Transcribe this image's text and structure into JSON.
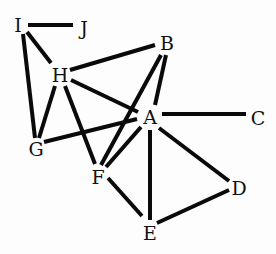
{
  "diagram": {
    "type": "undirected-graph",
    "nodes": [
      {
        "id": "I",
        "label": "I",
        "x": 18,
        "y": 25
      },
      {
        "id": "J",
        "label": "J",
        "x": 84,
        "y": 28
      },
      {
        "id": "H",
        "label": "H",
        "x": 60,
        "y": 75
      },
      {
        "id": "B",
        "label": "B",
        "x": 167,
        "y": 43
      },
      {
        "id": "A",
        "label": "A",
        "x": 150,
        "y": 117
      },
      {
        "id": "C",
        "label": "C",
        "x": 258,
        "y": 118
      },
      {
        "id": "G",
        "label": "G",
        "x": 36,
        "y": 149
      },
      {
        "id": "F",
        "label": "F",
        "x": 98,
        "y": 177
      },
      {
        "id": "D",
        "label": "D",
        "x": 239,
        "y": 188
      },
      {
        "id": "E",
        "label": "E",
        "x": 150,
        "y": 233
      }
    ],
    "edges": [
      {
        "from": "I",
        "to": "J",
        "x1": 28,
        "y1": 25,
        "x2": 73,
        "y2": 25
      },
      {
        "from": "I",
        "to": "H",
        "x1": 27,
        "y1": 32,
        "x2": 51,
        "y2": 63
      },
      {
        "from": "I",
        "to": "G",
        "x1": 23,
        "y1": 34,
        "x2": 35,
        "y2": 138
      },
      {
        "from": "H",
        "to": "B",
        "x1": 70,
        "y1": 70,
        "x2": 155,
        "y2": 45
      },
      {
        "from": "H",
        "to": "G",
        "x1": 55,
        "y1": 86,
        "x2": 39,
        "y2": 138
      },
      {
        "from": "H",
        "to": "F",
        "x1": 65,
        "y1": 86,
        "x2": 95,
        "y2": 164
      },
      {
        "from": "H",
        "to": "A",
        "x1": 71,
        "y1": 80,
        "x2": 138,
        "y2": 112
      },
      {
        "from": "B",
        "to": "A",
        "x1": 166,
        "y1": 55,
        "x2": 155,
        "y2": 105
      },
      {
        "from": "B",
        "to": "F",
        "x1": 161,
        "y1": 55,
        "x2": 101,
        "y2": 165
      },
      {
        "from": "A",
        "to": "C",
        "x1": 162,
        "y1": 114,
        "x2": 246,
        "y2": 114
      },
      {
        "from": "A",
        "to": "G",
        "x1": 137,
        "y1": 119,
        "x2": 44,
        "y2": 142
      },
      {
        "from": "A",
        "to": "F",
        "x1": 141,
        "y1": 127,
        "x2": 106,
        "y2": 167
      },
      {
        "from": "A",
        "to": "E",
        "x1": 150,
        "y1": 130,
        "x2": 150,
        "y2": 220
      },
      {
        "from": "A",
        "to": "D",
        "x1": 159,
        "y1": 128,
        "x2": 229,
        "y2": 181
      },
      {
        "from": "F",
        "to": "E",
        "x1": 108,
        "y1": 178,
        "x2": 142,
        "y2": 216
      },
      {
        "from": "E",
        "to": "D",
        "x1": 157,
        "y1": 223,
        "x2": 229,
        "y2": 190
      }
    ],
    "colors": {
      "edge": "#0a0a0a",
      "label": "#111111",
      "background": "#fdfdfd"
    }
  }
}
